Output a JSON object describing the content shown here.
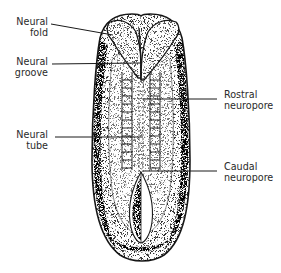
{
  "diagram": {
    "colors": {
      "ink": "#1a1a1a",
      "label_text": "#2a2a2a",
      "background": "#ffffff"
    },
    "labels": [
      {
        "id": "neural-fold",
        "line1": "Neural",
        "line2": "fold",
        "side": "left"
      },
      {
        "id": "neural-groove",
        "line1": "Neural",
        "line2": "groove",
        "side": "left"
      },
      {
        "id": "neural-tube",
        "line1": "Neural",
        "line2": "tube",
        "side": "left"
      },
      {
        "id": "rostral-neuropore",
        "line1": "Rostral",
        "line2": "neuropore",
        "side": "right"
      },
      {
        "id": "caudal-neuropore",
        "line1": "Caudal",
        "line2": "neuropore",
        "side": "right"
      }
    ]
  }
}
